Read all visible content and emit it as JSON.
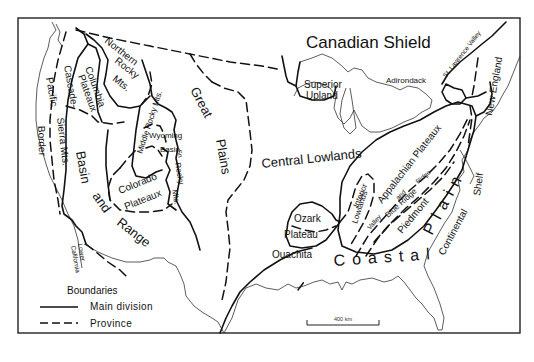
{
  "map": {
    "title": "Physiographic divisions of the United States",
    "regions": {
      "canadian_shield": "Canadian Shield",
      "superior_upland_1": "Superior",
      "superior_upland_2": "Upland",
      "adirondack": "Adirondack",
      "st_lawrence_valley": "St. Lawrence Valley",
      "new_england": "New England",
      "northern_rocky_1": "Northern",
      "northern_rocky_2": "Rocky",
      "northern_rocky_3": "Mts.",
      "columbia_plateau_1": "Columbia",
      "columbia_plateau_2": "Plateaux",
      "cascade_sierra_1": "Cascade-",
      "cascade_sierra_2": "Sierra Mts.",
      "pacific_border_1": "Pacific",
      "pacific_border_2": "Border",
      "middle_rocky": "Middle Rocky Mts.",
      "wyoming_basin_1": "Wyoming",
      "wyoming_basin_2": "Basin",
      "southern_rocky_1": "Sn",
      "southern_rocky_2": "Rocky",
      "southern_rocky_3": "Mts.",
      "great_plains_1": "Great",
      "great_plains_2": "Plains",
      "central_lowlands": "Central Lowlands",
      "colorado_plateau_1": "Colorado",
      "colorado_plateau_2": "Plateaux",
      "basin_and_range_1": "Basin",
      "basin_and_range_2": "and",
      "basin_and_range_3": "Range",
      "lower_california_1": "Lower",
      "lower_california_2": "California",
      "ozark_plateau_1": "Ozark",
      "ozark_plateau_2": "Plateau",
      "ouachita": "Ouachita",
      "interior_lowlands_1": "Interior",
      "interior_lowlands_2": "Lowlands",
      "appalachian_plateaux": "Appalachian Plateaux",
      "valley_and_ridge_1": "Valley",
      "valley_and_ridge_2": "and",
      "valley_and_ridge_3": "Ridge",
      "blue_ridge": "Blue Ridge",
      "piedmont": "Piedmont",
      "coastal": "Coastal",
      "plain": "Plain",
      "continental_shelf_1": "Continental",
      "continental_shelf_2": "Shelf"
    },
    "legend": {
      "title": "Boundaries",
      "items": [
        {
          "style": "solid",
          "label": "Main division"
        },
        {
          "style": "dashed",
          "label": "Province"
        }
      ]
    },
    "scale_bar": {
      "label": "400 km",
      "distance_km": 400
    }
  }
}
